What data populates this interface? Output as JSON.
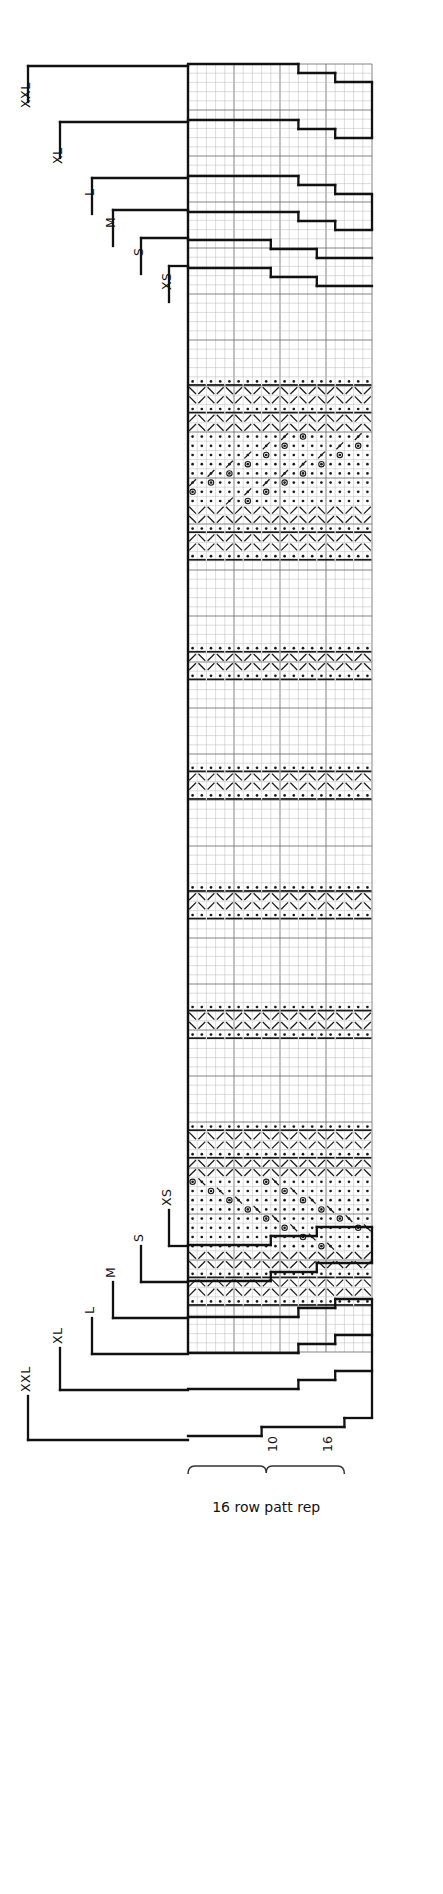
{
  "chart": {
    "kind": "knitting-stitch-chart",
    "repeat_caption": "16 row patt rep",
    "row_numbers": [
      {
        "label": "10",
        "col": 10
      },
      {
        "label": "16",
        "col": 16
      }
    ],
    "columns": 20,
    "rows": 140,
    "cell_px": 9.2,
    "grid_origin": {
      "x": 188,
      "y": 64
    },
    "colors": {
      "ink": "#1a1a1a",
      "grid_minor": "#b9b9b9",
      "grid_major": "#6e6e6e",
      "outline": "#111111",
      "paper": "#ffffff"
    }
  },
  "size_brackets_top": {
    "title": "size brackets top",
    "items": [
      {
        "label": "XXL",
        "arm_x": 28,
        "arm_y": 66,
        "stem_to": 102,
        "text_x": 30,
        "text_y": 108
      },
      {
        "label": "XL",
        "arm_x": 60,
        "arm_y": 122,
        "stem_to": 158,
        "text_x": 62,
        "text_y": 164
      },
      {
        "label": "L",
        "arm_x": 92,
        "arm_y": 178,
        "stem_to": 214,
        "text_x": 94,
        "text_y": 196
      },
      {
        "label": "M",
        "arm_x": 113,
        "arm_y": 210,
        "stem_to": 246,
        "text_x": 115,
        "text_y": 228
      },
      {
        "label": "S",
        "arm_x": 141,
        "arm_y": 238,
        "stem_to": 274,
        "text_x": 143,
        "text_y": 256
      },
      {
        "label": "XS",
        "arm_x": 169,
        "arm_y": 266,
        "stem_to": 302,
        "text_x": 171,
        "text_y": 290
      }
    ]
  },
  "size_brackets_bottom": {
    "title": "size brackets bottom",
    "items": [
      {
        "label": "XS",
        "arm_x": 169,
        "arm_y": 1246,
        "stem_to": 1210,
        "text_x": 171,
        "text_y": 1206
      },
      {
        "label": "S",
        "arm_x": 141,
        "arm_y": 1282,
        "stem_to": 1246,
        "text_x": 143,
        "text_y": 1242
      },
      {
        "label": "M",
        "arm_x": 113,
        "arm_y": 1318,
        "stem_to": 1282,
        "text_x": 115,
        "text_y": 1278
      },
      {
        "label": "L",
        "arm_x": 92,
        "arm_y": 1354,
        "stem_to": 1318,
        "text_x": 94,
        "text_y": 1314
      },
      {
        "label": "XL",
        "arm_x": 60,
        "arm_y": 1390,
        "stem_to": 1348,
        "text_x": 62,
        "text_y": 1344
      },
      {
        "label": "XXL",
        "arm_x": 28,
        "arm_y": 1440,
        "stem_to": 1396,
        "text_x": 30,
        "text_y": 1392
      }
    ]
  },
  "outline_top_steps": [
    {
      "from_col": 0,
      "to_col": 12,
      "y": 64
    },
    {
      "from_col": 12,
      "to_col": 16,
      "y": 73
    },
    {
      "from_col": 16,
      "to_col": 20,
      "y": 82
    },
    {
      "from_col": 0,
      "to_col": 12,
      "y": 120
    },
    {
      "from_col": 12,
      "to_col": 16,
      "y": 129
    },
    {
      "from_col": 16,
      "to_col": 20,
      "y": 138
    },
    {
      "from_col": 0,
      "to_col": 12,
      "y": 176
    },
    {
      "from_col": 12,
      "to_col": 16,
      "y": 185
    },
    {
      "from_col": 16,
      "to_col": 20,
      "y": 194
    },
    {
      "from_col": 0,
      "to_col": 12,
      "y": 212
    },
    {
      "from_col": 12,
      "to_col": 16,
      "y": 221
    },
    {
      "from_col": 16,
      "to_col": 20,
      "y": 230
    },
    {
      "from_col": 0,
      "to_col": 9,
      "y": 240
    },
    {
      "from_col": 9,
      "to_col": 14,
      "y": 249
    },
    {
      "from_col": 14,
      "to_col": 20,
      "y": 258
    },
    {
      "from_col": 0,
      "to_col": 9,
      "y": 268
    },
    {
      "from_col": 9,
      "to_col": 14,
      "y": 277
    },
    {
      "from_col": 14,
      "to_col": 20,
      "y": 286
    }
  ],
  "outline_bottom_steps": [
    {
      "from_col": 0,
      "to_col": 9,
      "y": 1245
    },
    {
      "from_col": 9,
      "to_col": 14,
      "y": 1236
    },
    {
      "from_col": 14,
      "to_col": 20,
      "y": 1227
    },
    {
      "from_col": 0,
      "to_col": 9,
      "y": 1281
    },
    {
      "from_col": 9,
      "to_col": 14,
      "y": 1272
    },
    {
      "from_col": 14,
      "to_col": 20,
      "y": 1263
    },
    {
      "from_col": 0,
      "to_col": 12,
      "y": 1317
    },
    {
      "from_col": 12,
      "to_col": 16,
      "y": 1308
    },
    {
      "from_col": 16,
      "to_col": 20,
      "y": 1299
    },
    {
      "from_col": 0,
      "to_col": 12,
      "y": 1353
    },
    {
      "from_col": 12,
      "to_col": 16,
      "y": 1344
    },
    {
      "from_col": 16,
      "to_col": 20,
      "y": 1335
    },
    {
      "from_col": 0,
      "to_col": 12,
      "y": 1389
    },
    {
      "from_col": 12,
      "to_col": 16,
      "y": 1380
    },
    {
      "from_col": 16,
      "to_col": 20,
      "y": 1371
    },
    {
      "from_col": 0,
      "to_col": 8,
      "y": 1436
    },
    {
      "from_col": 8,
      "to_col": 17,
      "y": 1427
    },
    {
      "from_col": 17,
      "to_col": 20,
      "y": 1418
    }
  ],
  "repeat_bracket": {
    "x_from_col": 0,
    "x_to_col": 17,
    "y": 1466,
    "caption_y": 1512
  },
  "symbols": {
    "legend": {
      "purl": "dot",
      "cable_bar": "thick-bar",
      "left_cross": "diagonal-left",
      "right_cross": "diagonal-right",
      "yarn_over": "circle"
    }
  },
  "pattern_bands": [
    {
      "name": "plain-top",
      "type": "plain",
      "start_row": 0,
      "row_count": 34
    },
    {
      "name": "texture-a1",
      "type": "purl",
      "start_row": 34,
      "row_count": 1
    },
    {
      "name": "texture-a2",
      "type": "cableL",
      "start_row": 35,
      "row_count": 2
    },
    {
      "name": "texture-a3",
      "type": "purl",
      "start_row": 37,
      "row_count": 1
    },
    {
      "name": "texture-a4",
      "type": "cableR",
      "start_row": 38,
      "row_count": 2
    },
    {
      "name": "lace-diamond-1",
      "type": "lace",
      "start_row": 40,
      "row_count": 8
    },
    {
      "name": "texture-a5",
      "type": "cableL",
      "start_row": 48,
      "row_count": 2
    },
    {
      "name": "texture-a6",
      "type": "purl",
      "start_row": 50,
      "row_count": 1
    },
    {
      "name": "texture-a7",
      "type": "cableR",
      "start_row": 51,
      "row_count": 2
    },
    {
      "name": "texture-a8",
      "type": "purl",
      "start_row": 53,
      "row_count": 1
    },
    {
      "name": "plain-b1",
      "type": "plain",
      "start_row": 54,
      "row_count": 9
    },
    {
      "name": "texture-b2",
      "type": "purl",
      "start_row": 63,
      "row_count": 1
    },
    {
      "name": "texture-b3",
      "type": "cableR",
      "start_row": 64,
      "row_count": 2
    },
    {
      "name": "texture-b4",
      "type": "purl",
      "start_row": 66,
      "row_count": 1
    },
    {
      "name": "plain-c1",
      "type": "plain",
      "start_row": 67,
      "row_count": 9
    },
    {
      "name": "texture-c2",
      "type": "purl",
      "start_row": 76,
      "row_count": 1
    },
    {
      "name": "texture-c3",
      "type": "cableR",
      "start_row": 77,
      "row_count": 2
    },
    {
      "name": "texture-c4",
      "type": "purl",
      "start_row": 79,
      "row_count": 1
    },
    {
      "name": "plain-d1",
      "type": "plain",
      "start_row": 80,
      "row_count": 9
    },
    {
      "name": "texture-d2",
      "type": "purl",
      "start_row": 89,
      "row_count": 1
    },
    {
      "name": "texture-d3",
      "type": "cableR",
      "start_row": 90,
      "row_count": 2
    },
    {
      "name": "texture-d4",
      "type": "purl",
      "start_row": 92,
      "row_count": 1
    },
    {
      "name": "plain-e1",
      "type": "plain",
      "start_row": 93,
      "row_count": 9
    },
    {
      "name": "texture-e2",
      "type": "purl",
      "start_row": 102,
      "row_count": 1
    },
    {
      "name": "texture-e3",
      "type": "cableL",
      "start_row": 103,
      "row_count": 2
    },
    {
      "name": "texture-e4",
      "type": "purl",
      "start_row": 105,
      "row_count": 1
    },
    {
      "name": "plain-f1",
      "type": "plain",
      "start_row": 106,
      "row_count": 9
    },
    {
      "name": "texture-f2",
      "type": "purl",
      "start_row": 115,
      "row_count": 1
    },
    {
      "name": "texture-f3",
      "type": "cableL",
      "start_row": 116,
      "row_count": 2
    },
    {
      "name": "texture-f4",
      "type": "purl",
      "start_row": 118,
      "row_count": 1
    },
    {
      "name": "texture-f5",
      "type": "cableR",
      "start_row": 119,
      "row_count": 2
    },
    {
      "name": "lace-diamond-2",
      "type": "laceDown",
      "start_row": 121,
      "row_count": 8
    },
    {
      "name": "texture-g1",
      "type": "cableL",
      "start_row": 129,
      "row_count": 2
    },
    {
      "name": "texture-g2",
      "type": "purl",
      "start_row": 131,
      "row_count": 1
    },
    {
      "name": "texture-g3",
      "type": "cableR",
      "start_row": 132,
      "row_count": 2
    },
    {
      "name": "texture-g4",
      "type": "purl",
      "start_row": 134,
      "row_count": 1
    },
    {
      "name": "plain-bottom",
      "type": "plain",
      "start_row": 135,
      "row_count": 5
    }
  ]
}
